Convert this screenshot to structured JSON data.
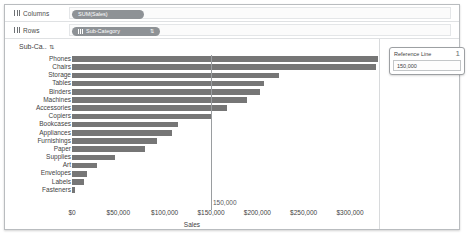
{
  "shelves": {
    "columns": {
      "label": "Columns",
      "icon": "grid-icon",
      "pill": "SUM(Sales)"
    },
    "rows": {
      "label": "Rows",
      "icon": "grid-icon",
      "pill": "Sub-Category",
      "sort_glyph": "⇅"
    }
  },
  "axis_header": {
    "label": "Sub-Ca..",
    "sort_glyph": "⇅"
  },
  "reference_card": {
    "title": "Reference Line",
    "index": "1",
    "value": "150,000"
  },
  "reference_line": {
    "label": "150,000",
    "value": 150000
  },
  "chart_data": {
    "type": "bar",
    "orientation": "horizontal",
    "title": "",
    "xlabel": "Sales",
    "ylabel": "Sub-Category",
    "xlim": [
      0,
      330000
    ],
    "grid": false,
    "legend": "none",
    "bar_color": "#767676",
    "reference_line": 150000,
    "tick_labels": [
      "$0",
      "$50,000",
      "$100,000",
      "$150,000",
      "$200,000",
      "$250,000",
      "$300,000"
    ],
    "ticks": [
      0,
      50000,
      100000,
      150000,
      200000,
      250000,
      300000
    ],
    "categories": [
      "Phones",
      "Chairs",
      "Storage",
      "Tables",
      "Binders",
      "Machines",
      "Accessories",
      "Copiers",
      "Bookcases",
      "Appliances",
      "Furnishings",
      "Paper",
      "Supplies",
      "Art",
      "Envelopes",
      "Labels",
      "Fasteners"
    ],
    "values": [
      330007,
      328449,
      223844,
      206966,
      203413,
      189239,
      167380,
      149528,
      114880,
      107532,
      91705,
      78479,
      46674,
      27119,
      16476,
      12486,
      3024
    ]
  }
}
